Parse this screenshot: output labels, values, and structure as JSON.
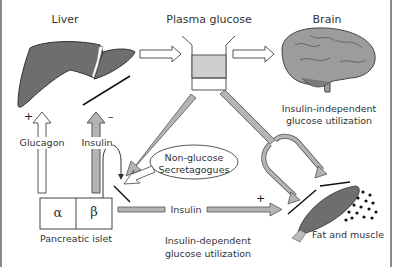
{
  "diagram": {
    "nodes": {
      "liver": {
        "label": "Liver"
      },
      "plasma_glucose": {
        "label": "Plasma glucose"
      },
      "brain": {
        "label": "Brain",
        "caption_line1": "Insulin-independent",
        "caption_line2": "glucose utilization"
      },
      "pancreatic_islet": {
        "label": "Pancreatic islet",
        "alpha": "α",
        "beta": "β"
      },
      "non_glucose": {
        "line1": "Non-glucose",
        "line2": "Secretagogues"
      },
      "fat_muscle": {
        "label": "Fat and muscle"
      }
    },
    "edges": {
      "glucagon": {
        "label": "Glucagon",
        "sign": "+"
      },
      "insulin_liver": {
        "label": "Insulin",
        "sign": "–"
      },
      "insulin_periphery": {
        "label": "Insulin",
        "sign": "+"
      }
    },
    "bottom_caption": {
      "line1": "Insulin-dependent",
      "line2": "glucose utilization"
    }
  },
  "colors": {
    "organ_fill": "#6e6e6e",
    "arrow_gray": "#b4b4b4",
    "outline": "#555555",
    "beaker_fill": "#cfcfcf",
    "border": "#888888"
  }
}
